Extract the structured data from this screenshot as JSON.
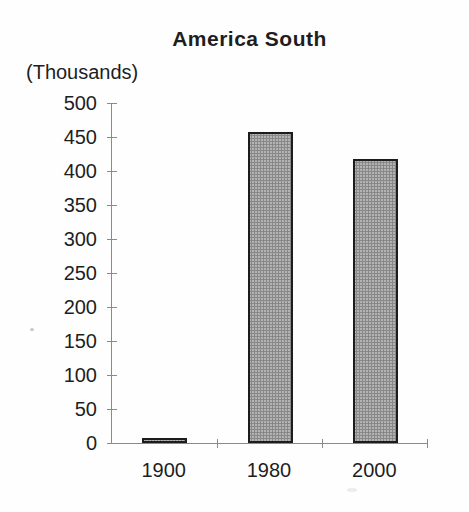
{
  "chart_data": {
    "type": "bar",
    "title": "America South",
    "ylabel": "(Thousands)",
    "xlabel": "",
    "categories": [
      "1900",
      "1980",
      "2000"
    ],
    "values": [
      7,
      458,
      418
    ],
    "ylim": [
      0,
      500
    ],
    "ytick_step": 50,
    "yticks": [
      0,
      50,
      100,
      150,
      200,
      250,
      300,
      350,
      400,
      450,
      500
    ],
    "grid": false,
    "legend": false,
    "bar_fill": "#b3b3b3",
    "bar_border": "#1c1c1c",
    "axis_color": "#8a8a8a",
    "text_color": "#1e1e1e"
  }
}
